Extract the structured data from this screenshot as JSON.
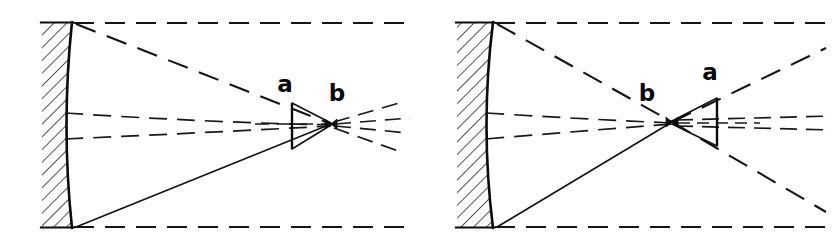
{
  "figure": {
    "background_color": "#ffffff",
    "ink_color": "#111111",
    "width": 839,
    "height": 247,
    "panel_count": 2
  },
  "panels": [
    {
      "id": "left-panel",
      "name": "left-diagram",
      "description": "Concave mirror with converging rays meeting at focus; vertical segment a before focus, focus b",
      "labels": [
        {
          "key": "a",
          "text": "a",
          "x": 285,
          "y": 92,
          "role": "image-plane-label"
        },
        {
          "key": "b",
          "text": "b",
          "x": 337,
          "y": 101,
          "role": "focus-label"
        }
      ],
      "mirror": {
        "name": "concave-mirror",
        "top_x": 72,
        "top_y": 22,
        "bottom_x": 72,
        "bottom_y": 228,
        "bulge_x": 62,
        "bulge_y": 125
      },
      "hatch_block": {
        "x": 42,
        "y": 22,
        "width": 30,
        "height": 206
      },
      "focus": {
        "x": 331,
        "y": 124
      },
      "segment_a": {
        "x": 292,
        "top_y": 103,
        "bottom_y": 149
      }
    },
    {
      "id": "right-panel",
      "name": "right-diagram",
      "description": "Concave mirror with rays crossing at focus b then diverging; vertical segment a after focus",
      "labels": [
        {
          "key": "b",
          "text": "b",
          "x": 647,
          "y": 101,
          "role": "focus-label"
        },
        {
          "key": "a",
          "text": "a",
          "x": 710,
          "y": 80,
          "role": "image-plane-label"
        }
      ],
      "mirror": {
        "name": "concave-mirror",
        "top_x": 493,
        "top_y": 22,
        "bottom_x": 493,
        "bottom_y": 228,
        "bulge_x": 481,
        "bulge_y": 125
      },
      "hatch_block": {
        "x": 457,
        "y": 22,
        "width": 36,
        "height": 206
      },
      "focus": {
        "x": 672,
        "y": 122
      },
      "segment_a": {
        "x": 717,
        "top_y": 98,
        "bottom_y": 146
      }
    }
  ],
  "legend_notes": {
    "solid_line_meaning": "mirror surface and principal marginal ray",
    "dashed_line_meaning": "light ray path",
    "hatching_meaning": "mirror backing material"
  }
}
